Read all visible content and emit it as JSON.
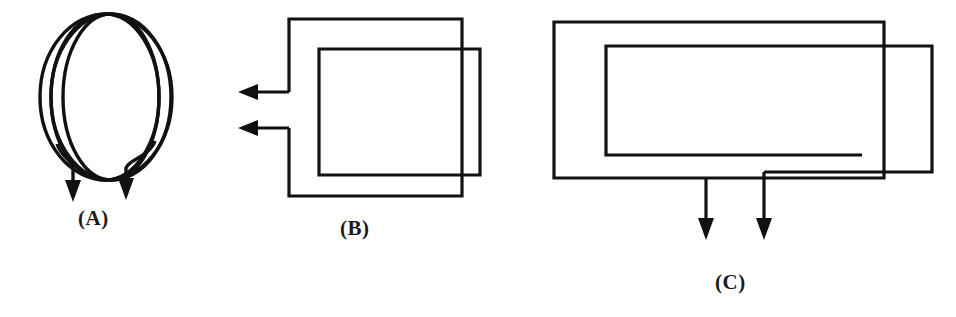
{
  "figure": {
    "background_color": "#ffffff",
    "stroke_color": "#111111",
    "width": 956,
    "height": 317,
    "panels": [
      {
        "id": "A",
        "label": "(A)",
        "shape": "circular-coil",
        "turns": 4,
        "lead_count": 2,
        "lead_direction": "down",
        "arrowheads": 2,
        "description": "Multi-turn circular (helical) coil with two leads exiting downward, each terminated by a downward arrowhead"
      },
      {
        "id": "B",
        "label": "(B)",
        "shape": "square-coil",
        "turns": 2,
        "lead_count": 2,
        "lead_direction": "left",
        "arrowheads": 2,
        "description": "Two offset overlapping square turns with two leads exiting to the left, each terminated by a leftward arrowhead"
      },
      {
        "id": "C",
        "label": "(C)",
        "shape": "rectangular-coil",
        "turns": 2,
        "lead_count": 2,
        "lead_direction": "down",
        "arrowheads": 2,
        "description": "Two offset overlapping rectangular turns with two leads exiting downward, each terminated by a downward arrowhead"
      }
    ]
  }
}
